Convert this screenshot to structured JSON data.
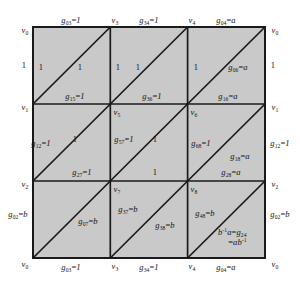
{
  "figure": {
    "colors": {
      "face_fill": "#c9c9c9",
      "line": "#1a1a1a",
      "background": "#ffffff",
      "text": "#141414"
    },
    "grid": {
      "columns": 3,
      "rows": 3,
      "diagonal_direction": "bottom-left-to-top-right",
      "left": 33,
      "top": 27,
      "right": 265,
      "bottom": 258
    },
    "vertices": {
      "top": [
        {
          "name": "v0",
          "label": "v",
          "sub": "0"
        },
        {
          "name": "v3",
          "label": "v",
          "sub": "3"
        },
        {
          "name": "v4",
          "label": "v",
          "sub": "4"
        },
        {
          "name": "v0r",
          "label": "v",
          "sub": "0"
        }
      ],
      "middle_upper": [
        {
          "name": "v1",
          "label": "v",
          "sub": "1"
        },
        {
          "name": "v5",
          "label": "v",
          "sub": "5"
        },
        {
          "name": "v6",
          "label": "v",
          "sub": "6"
        },
        {
          "name": "v1r",
          "label": "v",
          "sub": "1"
        }
      ],
      "middle_lower": [
        {
          "name": "v2",
          "label": "v",
          "sub": "2"
        },
        {
          "name": "v7",
          "label": "v",
          "sub": "7"
        },
        {
          "name": "v8",
          "label": "v",
          "sub": "8"
        },
        {
          "name": "v2r",
          "label": "v",
          "sub": "2"
        }
      ],
      "bottom": [
        {
          "name": "v0b",
          "label": "v",
          "sub": "0"
        },
        {
          "name": "v3b",
          "label": "v",
          "sub": "3"
        },
        {
          "name": "v4b",
          "label": "v",
          "sub": "4"
        },
        {
          "name": "v0br",
          "label": "v",
          "sub": "0"
        }
      ]
    },
    "edge_labels": {
      "top_row": [
        {
          "name": "g03-top",
          "g": "g",
          "sub": "03",
          "value": "1"
        },
        {
          "name": "g34-top",
          "g": "g",
          "sub": "34",
          "value": "1"
        },
        {
          "name": "g04-top",
          "g": "g",
          "sub": "04",
          "value": "a"
        }
      ],
      "bottom_row": [
        {
          "name": "g03-bottom",
          "g": "g",
          "sub": "03",
          "value": "1"
        },
        {
          "name": "g34-bottom",
          "g": "g",
          "sub": "34",
          "value": "1"
        },
        {
          "name": "g04-bottom",
          "g": "g",
          "sub": "04",
          "value": "a"
        }
      ],
      "left_column": [
        {
          "name": "left-1",
          "plain": "1"
        },
        {
          "name": "g12-left",
          "g": "g",
          "sub": "12",
          "value": "1"
        },
        {
          "name": "g02-left",
          "g": "g",
          "sub": "02",
          "value": "b"
        }
      ],
      "right_column": [
        {
          "name": "right-1",
          "plain": "1"
        },
        {
          "name": "g12-right",
          "g": "g",
          "sub": "12",
          "value": "1"
        },
        {
          "name": "g02-right",
          "g": "g",
          "sub": "02",
          "value": "b"
        }
      ],
      "interior_band1": [
        {
          "name": "g15",
          "g": "g",
          "sub": "15",
          "value": "1"
        },
        {
          "name": "g36",
          "g": "g",
          "sub": "36",
          "value": "1"
        },
        {
          "name": "g16",
          "g": "g",
          "sub": "16",
          "value": "a"
        }
      ],
      "interior_band2": [
        {
          "name": "g27",
          "g": "g",
          "sub": "27",
          "value": "1"
        },
        {
          "name": "band2-1",
          "plain": "1"
        },
        {
          "name": "g28",
          "g": "g",
          "sub": "28",
          "value": "a"
        }
      ],
      "interior_band3": [
        {
          "name": "g07",
          "g": "g",
          "sub": "07",
          "value": "b"
        },
        {
          "name": "g38",
          "g": "g",
          "sub": "38",
          "value": "b"
        }
      ],
      "interior_vertical_mid": [
        {
          "name": "g57",
          "g": "g",
          "sub": "57",
          "value": "1"
        },
        {
          "name": "g68",
          "g": "g",
          "sub": "68",
          "value": "1"
        },
        {
          "name": "g37",
          "g": "g",
          "sub": "37",
          "value": "b"
        },
        {
          "name": "g48",
          "g": "g",
          "sub": "48",
          "value": "b"
        }
      ],
      "diagonals": [
        {
          "name": "diag-1-1",
          "plain": "1"
        },
        {
          "name": "diag-1-2",
          "plain": "1"
        },
        {
          "name": "diag-1-3",
          "plain": "1"
        },
        {
          "name": "diag-1-4",
          "plain": "1"
        },
        {
          "name": "diag-1-5",
          "plain": "1"
        },
        {
          "name": "g06",
          "g": "g",
          "sub": "06",
          "value": "a"
        },
        {
          "name": "diag-2-1",
          "plain": "1"
        },
        {
          "name": "diag-2-2",
          "plain": "1"
        },
        {
          "name": "g18",
          "g": "g",
          "sub": "18",
          "value": "a"
        }
      ],
      "corner_relation": {
        "name": "relation-g24",
        "line1_prefix": "b",
        "line1_sup": "-1",
        "line1_mid": "a",
        "line1_eq": "=",
        "line1_g": "g",
        "line1_sub": "24",
        "line2_eq": "=",
        "line2_a": "a",
        "line2_b": "b",
        "line2_sup": "-1"
      }
    }
  }
}
